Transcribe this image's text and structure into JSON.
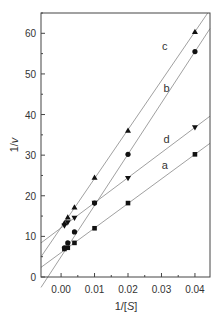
{
  "chart_data": {
    "type": "line",
    "title": "",
    "xlabel": "1/[S]",
    "ylabel": "1/v",
    "xlim": [
      -0.006,
      0.0445
    ],
    "ylim": [
      0,
      65
    ],
    "xticks": [
      0.0,
      0.01,
      0.02,
      0.03,
      0.04
    ],
    "xtick_labels": [
      "0.00",
      "0.01",
      "0.02",
      "0.03",
      "0.04"
    ],
    "yticks": [
      0,
      10,
      20,
      30,
      40,
      50,
      60
    ],
    "ytick_labels": [
      "0",
      "10",
      "20",
      "30",
      "40",
      "50",
      "60"
    ],
    "grid": false,
    "legend": "inline line labels",
    "series": [
      {
        "name": "a",
        "marker": "square",
        "x": [
          0.001,
          0.002,
          0.004,
          0.01,
          0.02,
          0.04
        ],
        "values": [
          6.9,
          7.2,
          8.4,
          12.0,
          18.2,
          30.2
        ],
        "fit": {
          "intercept": 6.0,
          "slope": 605
        },
        "label_pos": [
          0.031,
          26.5
        ]
      },
      {
        "name": "b",
        "marker": "circle",
        "x": [
          0.001,
          0.002,
          0.004,
          0.01,
          0.02,
          0.04
        ],
        "values": [
          7.2,
          8.4,
          11.1,
          18.2,
          30.2,
          55.5
        ],
        "fit": {
          "intercept": 5.0,
          "slope": 1262
        },
        "label_pos": [
          0.0315,
          45.5
        ]
      },
      {
        "name": "c",
        "marker": "triangle-up",
        "x": [
          0.001,
          0.002,
          0.004,
          0.01,
          0.02,
          0.04
        ],
        "values": [
          13.3,
          14.7,
          17.2,
          24.5,
          36.1,
          60.4
        ],
        "fit": {
          "intercept": 12.2,
          "slope": 1205
        },
        "label_pos": [
          0.031,
          56.0
        ]
      },
      {
        "name": "d",
        "marker": "triangle-down",
        "x": [
          0.001,
          0.002,
          0.004,
          0.01,
          0.02,
          0.04
        ],
        "values": [
          12.6,
          13.4,
          14.5,
          18.2,
          24.3,
          36.8
        ],
        "fit": {
          "intercept": 12.1,
          "slope": 618
        },
        "label_pos": [
          0.0315,
          33.0
        ]
      }
    ]
  },
  "colors": {
    "axis": "#444444",
    "line": "#888888",
    "marker": "#111111",
    "text": "#333333"
  }
}
